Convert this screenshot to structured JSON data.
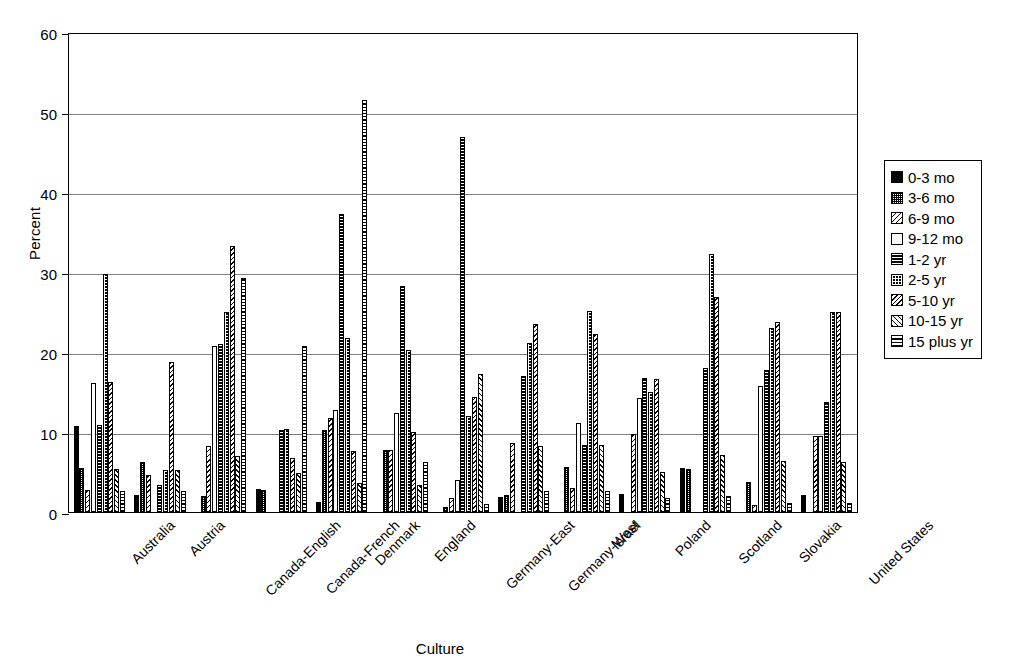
{
  "chart_data": {
    "type": "bar",
    "title": "",
    "xlabel": "Culture",
    "ylabel": "Percent",
    "ylim": [
      0,
      60
    ],
    "yticks": [
      0,
      10,
      20,
      30,
      40,
      50,
      60
    ],
    "grid": true,
    "legend_position": "right",
    "legend_entries": [
      "0-3 mo",
      "3-6 mo",
      "6-9 mo",
      "9-12 mo",
      "1-2 yr",
      "2-5 yr",
      "5-10 yr",
      "10-15 yr",
      "15 plus yr"
    ],
    "categories": [
      "Australia",
      "Austria",
      "Canada-English",
      "Canada-French",
      "Denmark",
      "England",
      "Germany-East",
      "Germany-West",
      "Israel",
      "Poland",
      "Scotland",
      "Slovakia",
      "United States"
    ],
    "series": [
      {
        "name": "0-3 mo",
        "values": [
          10.8,
          2.1,
          0.0,
          2.9,
          1.2,
          0.0,
          0.0,
          1.9,
          0.0,
          2.2,
          5.5,
          0.0,
          2.1
        ]
      },
      {
        "name": "3-6 mo",
        "values": [
          5.5,
          6.2,
          2.0,
          2.8,
          10.3,
          7.8,
          0.6,
          2.1,
          5.6,
          0.0,
          5.4,
          3.8,
          0.0
        ]
      },
      {
        "name": "6-9 mo",
        "values": [
          2.7,
          4.6,
          8.3,
          0.0,
          11.7,
          7.7,
          1.8,
          8.6,
          3.0,
          9.7,
          0.0,
          0.9,
          9.5
        ]
      },
      {
        "name": "9-12 mo",
        "values": [
          16.1,
          0.0,
          20.8,
          0.0,
          12.8,
          12.4,
          4.0,
          0.0,
          11.1,
          14.3,
          0.0,
          15.7,
          9.5
        ]
      },
      {
        "name": "1-2 yr",
        "values": [
          10.9,
          3.4,
          21.0,
          10.3,
          37.2,
          28.2,
          46.9,
          17.0,
          8.4,
          16.7,
          18.0,
          17.8,
          13.8
        ]
      },
      {
        "name": "2-5 yr",
        "values": [
          29.8,
          5.3,
          25.0,
          10.4,
          21.8,
          20.3,
          12.0,
          21.1,
          25.1,
          15.0,
          32.3,
          23.0,
          25.0
        ]
      },
      {
        "name": "5-10 yr",
        "values": [
          16.2,
          18.7,
          33.3,
          6.8,
          7.6,
          10.0,
          14.4,
          23.5,
          22.2,
          16.6,
          26.9,
          23.8,
          25.0
        ]
      },
      {
        "name": "10-15 yr",
        "values": [
          5.4,
          5.3,
          7.0,
          4.9,
          3.6,
          3.4,
          17.2,
          8.2,
          8.4,
          5.0,
          7.1,
          6.4,
          6.3
        ]
      },
      {
        "name": "15 plus yr",
        "values": [
          2.6,
          2.6,
          29.2,
          20.8,
          51.5,
          6.3,
          1.0,
          2.6,
          2.6,
          1.7,
          2.0,
          1.1,
          1.1
        ]
      }
    ]
  },
  "axis": {
    "y_title": "Percent",
    "x_title": "Culture"
  }
}
